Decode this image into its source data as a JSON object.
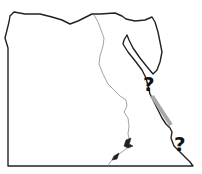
{
  "map": {
    "subject": "Egypt outline map",
    "markers": [
      {
        "id": "q1",
        "label": "?",
        "x": 143,
        "y": 74
      },
      {
        "id": "q2",
        "label": "?",
        "x": 174,
        "y": 133
      }
    ],
    "highlight_segment": {
      "color": "#a9a9a9"
    },
    "colors": {
      "border": "#222222",
      "river": "#888888",
      "background": "#ffffff"
    }
  }
}
